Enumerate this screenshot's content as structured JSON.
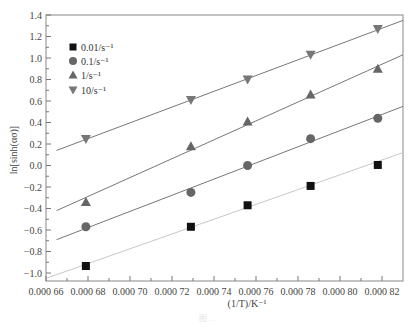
{
  "chart_data": {
    "type": "scatter",
    "title": "",
    "xlabel": "(1/T)/K⁻¹",
    "ylabel": "ln[sinh(ασ)]",
    "xlim": [
      0.00066,
      0.00083
    ],
    "ylim": [
      -1.075,
      1.4
    ],
    "grid": false,
    "legend_position": "upper left",
    "x_ticks": [
      0.00066,
      0.00068,
      0.0007,
      0.00072,
      0.00074,
      0.00076,
      0.00078,
      0.0008,
      0.00082
    ],
    "x_tick_labels": [
      "0.000 66",
      "0.000 68",
      "0.000 70",
      "0.000 72",
      "0.000 74",
      "0.000 76",
      "0.000 78",
      "0.000 80",
      "0.000 82"
    ],
    "y_ticks": [
      1.4,
      1.2,
      1.0,
      0.8,
      0.6,
      0.4,
      0.2,
      0.0,
      -0.2,
      -0.4,
      -0.6,
      -0.8,
      -1.0
    ],
    "y_tick_labels": [
      "1.4",
      "1.2",
      "1.0",
      "0.8",
      "0.6",
      "0.4",
      "0.2",
      "0.0",
      "−0.2",
      "−0.4",
      "−0.6",
      "−0.8",
      "−1.0"
    ],
    "x": [
      0.000679,
      0.000729,
      0.000756,
      0.000786,
      0.000818
    ],
    "series": [
      {
        "name": "0.01/s⁻¹",
        "marker": "square",
        "color": "#111111",
        "line_color": "#c8c8c8",
        "values": [
          -0.935,
          -0.57,
          -0.37,
          -0.19,
          0.005
        ],
        "fit_line": {
          "x": [
            0.00066,
            0.00083
          ],
          "y": [
            -1.05,
            0.12
          ]
        }
      },
      {
        "name": "0.1/s⁻¹",
        "marker": "circle",
        "color": "#666666",
        "line_color": "#777777",
        "values": [
          -0.57,
          -0.25,
          0.0,
          0.25,
          0.44
        ],
        "fit_line": {
          "x": [
            0.000665,
            0.00083
          ],
          "y": [
            -0.69,
            0.55
          ]
        }
      },
      {
        "name": "1/s⁻¹",
        "marker": "triangle-up",
        "color": "#666666",
        "line_color": "#777777",
        "values": [
          -0.34,
          0.18,
          0.41,
          0.66,
          0.9
        ],
        "fit_line": {
          "x": [
            0.000665,
            0.00083
          ],
          "y": [
            -0.42,
            1.03
          ]
        }
      },
      {
        "name": "10/s⁻¹",
        "marker": "triangle-down",
        "color": "#777777",
        "line_color": "#777777",
        "values": [
          0.247,
          0.61,
          0.8,
          1.03,
          1.27
        ],
        "fit_line": {
          "x": [
            0.000665,
            0.00083
          ],
          "y": [
            0.14,
            1.35
          ]
        }
      }
    ]
  },
  "caption": "图  …"
}
